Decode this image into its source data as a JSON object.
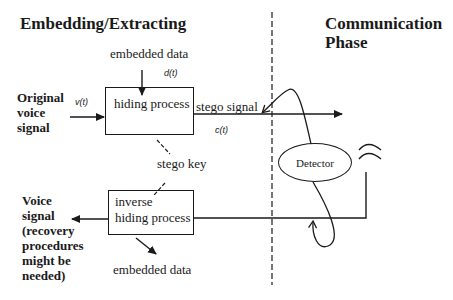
{
  "headings": {
    "left": "Embedding/Extracting",
    "right_line1": "Communication",
    "right_line2": "Phase"
  },
  "inputs": {
    "embedded_data_top": "embedded data",
    "d_t": "d(t)",
    "original_voice_line1": "Original",
    "original_voice_line2": "voice",
    "original_voice_line3": "signal",
    "v_t": "v(t)"
  },
  "boxes": {
    "hiding_process": "hiding process",
    "inverse_line1": "inverse",
    "inverse_line2": "hiding process"
  },
  "signals": {
    "stego_signal": "stego signal",
    "c_t": "c(t)",
    "stego_key": "stego key",
    "detector": "Detector"
  },
  "outputs": {
    "voice_line1": "Voice",
    "voice_line2": "signal",
    "voice_line3": "(recovery",
    "voice_line4": "procedures",
    "voice_line5": "might be",
    "voice_line6": "needed)",
    "embedded_data_bottom": "embedded data"
  }
}
